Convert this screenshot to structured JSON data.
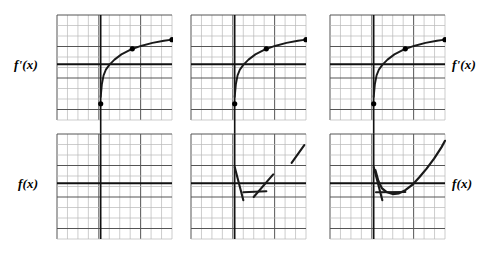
{
  "figure": {
    "background_color": "#ffffff",
    "curve_color": "#1a1a1a",
    "grid_minor_color": "#b8b8b8",
    "grid_major_color": "#555555",
    "axis_color": "#111111",
    "point_color": "#000000"
  },
  "labels": {
    "fprime_left": "f'(x)",
    "fprime_right": "f'(x)",
    "f_left": "f(x)",
    "f_right": "f(x)"
  },
  "panels": {
    "grid": {
      "cols": 11,
      "rows": 10,
      "cell_w": 10.5,
      "cell_h": 10.5,
      "major_every_col": 4,
      "major_every_row": 3
    },
    "top": [
      {
        "name": "fprime-panel-1",
        "x": 56,
        "y": 14,
        "w": 115,
        "h": 105
      },
      {
        "name": "fprime-panel-2",
        "x": 190,
        "y": 14,
        "w": 115,
        "h": 105
      },
      {
        "name": "fprime-panel-3",
        "x": 329,
        "y": 14,
        "w": 115,
        "h": 105
      }
    ],
    "bottom": [
      {
        "name": "f-panel-1",
        "x": 56,
        "y": 133,
        "w": 115,
        "h": 105
      },
      {
        "name": "f-panel-2",
        "x": 190,
        "y": 133,
        "w": 115,
        "h": 105
      },
      {
        "name": "f-panel-3",
        "x": 329,
        "y": 133,
        "w": 115,
        "h": 105
      }
    ]
  },
  "chart_data": {
    "type": "line",
    "xlabel": "",
    "ylabel": "",
    "grid": true,
    "legend": "none",
    "panel_axes": {
      "x_axis_row_fraction": 0.47,
      "y_axis_col_fraction": 0.38,
      "y_axis_overshoot_below": 14
    },
    "fprime_curve": {
      "description": "Increasing concave-down curve resembling a logarithm, rising steeply from a low starting point then flattening above the horizontal axis.",
      "points": [
        [
          0.38,
          0.78
        ],
        [
          0.39,
          0.66
        ],
        [
          0.405,
          0.575
        ],
        [
          0.425,
          0.52
        ],
        [
          0.455,
          0.475
        ],
        [
          0.5,
          0.425
        ],
        [
          0.56,
          0.375
        ],
        [
          0.64,
          0.33
        ],
        [
          0.73,
          0.295
        ],
        [
          0.83,
          0.265
        ],
        [
          0.93,
          0.245
        ],
        [
          1.0,
          0.235
        ]
      ],
      "marked_points": [
        {
          "x": 0.38,
          "y": 0.845,
          "label": ""
        },
        {
          "x": 0.655,
          "y": 0.322,
          "label": ""
        },
        {
          "x": 1.0,
          "y": 0.235,
          "label": ""
        }
      ]
    },
    "f_segments_panel2": [
      {
        "x1": 0.38,
        "y1": 0.315,
        "x2": 0.455,
        "y2": 0.63,
        "slope": "steep-negative-visual"
      },
      {
        "x1": 0.455,
        "y1": 0.555,
        "x2": 0.655,
        "y2": 0.545,
        "slope": "near-zero"
      },
      {
        "x1": 0.545,
        "y1": 0.6,
        "x2": 0.715,
        "y2": 0.385,
        "slope": "moderate-positive"
      },
      {
        "x1": 0.875,
        "y1": 0.275,
        "x2": 0.985,
        "y2": 0.105,
        "slope": "positive"
      }
    ],
    "f_segments_panel3": [
      {
        "x1": 0.38,
        "y1": 0.315,
        "x2": 0.455,
        "y2": 0.63,
        "slope": "steep-negative-visual"
      },
      {
        "x1": 0.4,
        "y1": 0.555,
        "x2": 0.655,
        "y2": 0.552,
        "slope": "near-zero"
      }
    ],
    "f_curve_panel3": {
      "description": "Upward-opening curve with a minimum near the horizontal axis that rises steeply to the upper right.",
      "points": [
        [
          0.395,
          0.345
        ],
        [
          0.42,
          0.445
        ],
        [
          0.45,
          0.515
        ],
        [
          0.49,
          0.552
        ],
        [
          0.545,
          0.572
        ],
        [
          0.6,
          0.565
        ],
        [
          0.655,
          0.535
        ],
        [
          0.715,
          0.485
        ],
        [
          0.775,
          0.415
        ],
        [
          0.84,
          0.33
        ],
        [
          0.905,
          0.235
        ],
        [
          0.97,
          0.125
        ],
        [
          1.0,
          0.065
        ]
      ]
    }
  }
}
